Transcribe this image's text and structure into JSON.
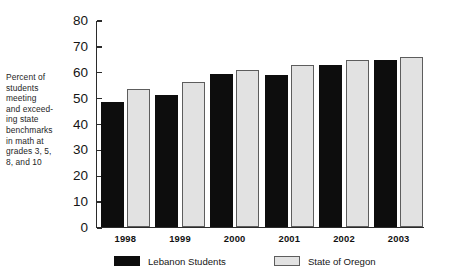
{
  "chart_data": {
    "type": "bar",
    "title": "",
    "subtitle": "",
    "xlabel": "",
    "ylabel": "Percent of students meeting and exceeding state benchmarks in math at grades 3, 5, 8, and 10",
    "categories": [
      "1998",
      "1999",
      "2000",
      "2001",
      "2002",
      "2003"
    ],
    "series": [
      {
        "name": "Lebanon Students",
        "color": "#0d0d0d",
        "values": [
          48,
          51,
          59,
          58.5,
          62.5,
          64.5
        ]
      },
      {
        "name": "State of Oregon",
        "color": "#e2e2e2",
        "values": [
          53,
          56,
          60.5,
          62.5,
          64.5,
          65.5
        ]
      }
    ],
    "ylim": [
      0,
      80
    ],
    "ytick_step": 10,
    "yticks": [
      "80",
      "70",
      "60",
      "50",
      "40",
      "30",
      "20",
      "10",
      "0"
    ],
    "grid": false,
    "legend_position": "bottom"
  },
  "axis_caption": {
    "lines": [
      "Percent of",
      "students",
      "meeting",
      "and exceed-",
      "ing state",
      "benchmarks",
      "in math at",
      "grades 3, 5,",
      "8, and 10"
    ]
  },
  "legend": {
    "entries": [
      {
        "label": "Lebanon Students"
      },
      {
        "label": "State of Oregon"
      }
    ]
  }
}
